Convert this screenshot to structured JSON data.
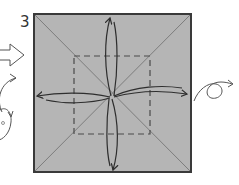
{
  "diagram": {
    "step_number": "3",
    "paper_color": "#b5b5b5",
    "edge_color": "#3a3a3a",
    "crease_color": "#7d7d7d",
    "dash_color": "#4a4a4a",
    "arrow_color": "#2e2e2e",
    "symbols": {
      "left": [
        "hollow-push-arrow",
        "turn-over-arrow",
        "rotate-arrow"
      ],
      "right": [
        "turn-over-arrow"
      ]
    }
  }
}
